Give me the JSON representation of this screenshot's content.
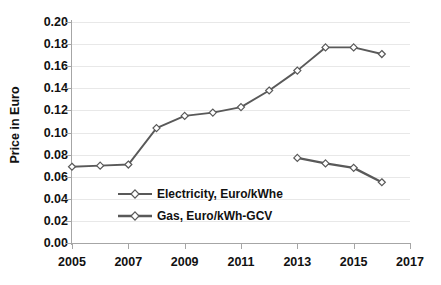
{
  "chart_data": {
    "type": "line",
    "title": "",
    "xlabel": "",
    "ylabel": "Price in Euro",
    "xlim": [
      2005,
      2017
    ],
    "ylim": [
      0.0,
      0.2
    ],
    "grid": true,
    "legend_position": "inside-lower-left",
    "y_ticks": [
      "0.00",
      "0.02",
      "0.04",
      "0.06",
      "0.08",
      "0.10",
      "0.12",
      "0.14",
      "0.16",
      "0.18",
      "0.20"
    ],
    "y_tick_values": [
      0.0,
      0.02,
      0.04,
      0.06,
      0.08,
      0.1,
      0.12,
      0.14,
      0.16,
      0.18,
      0.2
    ],
    "x_ticks": [
      "2005",
      "2007",
      "2009",
      "2011",
      "2013",
      "2015",
      "2017"
    ],
    "x_tick_values": [
      2005,
      2007,
      2009,
      2011,
      2013,
      2015,
      2017
    ],
    "series": [
      {
        "name": "Electricity, Euro/kWhe",
        "color": "#595959",
        "marker": "diamond-open",
        "x": [
          2005,
          2006,
          2007,
          2008,
          2009,
          2010,
          2011,
          2012,
          2013,
          2014,
          2015,
          2016
        ],
        "values": [
          0.069,
          0.07,
          0.071,
          0.104,
          0.115,
          0.118,
          0.123,
          0.138,
          0.156,
          0.177,
          0.177,
          0.171
        ]
      },
      {
        "name": "Gas, Euro/kWh-GCV",
        "color": "#595959",
        "marker": "diamond-open",
        "x": [
          2013,
          2014,
          2015,
          2016
        ],
        "values": [
          0.077,
          0.072,
          0.068,
          0.055
        ]
      }
    ]
  },
  "legend": {
    "items": [
      {
        "label": "Electricity, Euro/kWhe"
      },
      {
        "label": "Gas, Euro/kWh-GCV"
      }
    ]
  },
  "colors": {
    "series_line": "#595959",
    "marker_fill": "#ffffff",
    "gridline": "#e8e8e8",
    "axis": "#a6a6a6",
    "text": "#111111",
    "background": "#ffffff"
  }
}
